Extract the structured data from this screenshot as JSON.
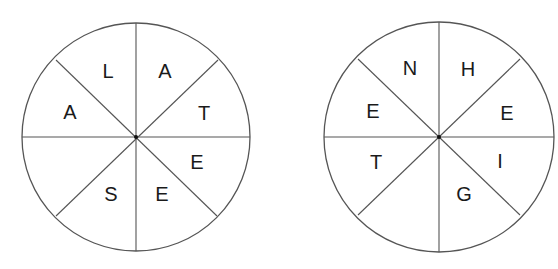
{
  "wheels": [
    {
      "id": "left",
      "cx": 136,
      "cy": 137,
      "r": 114,
      "letters": [
        {
          "char": "L",
          "x": 108,
          "y": 71
        },
        {
          "char": "A",
          "x": 165,
          "y": 71
        },
        {
          "char": "A",
          "x": 70,
          "y": 112
        },
        {
          "char": "T",
          "x": 204,
          "y": 113
        },
        {
          "char": "E",
          "x": 197,
          "y": 162
        },
        {
          "char": "S",
          "x": 111,
          "y": 194
        },
        {
          "char": "E",
          "x": 162,
          "y": 194
        }
      ],
      "empty_sector": "lower-left"
    },
    {
      "id": "right",
      "cx": 439,
      "cy": 137,
      "r": 115,
      "letters": [
        {
          "char": "N",
          "x": 410,
          "y": 68
        },
        {
          "char": "H",
          "x": 468,
          "y": 69
        },
        {
          "char": "E",
          "x": 373,
          "y": 111
        },
        {
          "char": "E",
          "x": 507,
          "y": 113
        },
        {
          "char": "T",
          "x": 376,
          "y": 162
        },
        {
          "char": "I",
          "x": 500,
          "y": 161
        },
        {
          "char": "G",
          "x": 464,
          "y": 194
        }
      ],
      "empty_sector": "lower-left"
    }
  ],
  "colors": {
    "line": "#555555",
    "text": "#1a1a1a",
    "background": "#ffffff"
  }
}
